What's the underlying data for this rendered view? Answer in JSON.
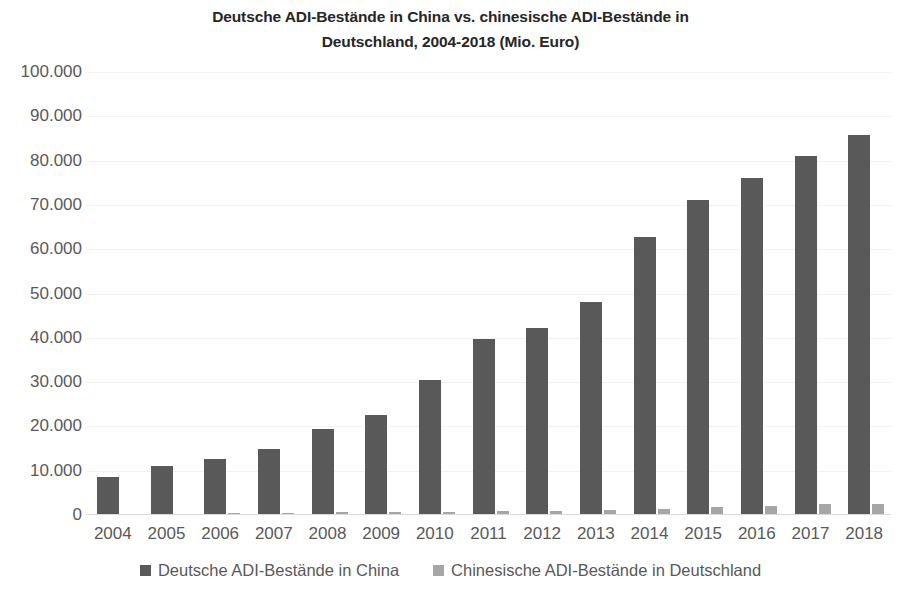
{
  "chart_data": {
    "type": "bar",
    "title": "Deutsche ADI-Bestände in China vs. chinesische ADI-Bestände in Deutschland, 2004-2018 (Mio. Euro)",
    "title_line1": "Deutsche ADI-Bestände in China vs. chinesische ADI-Bestände in",
    "title_line2": "Deutschland, 2004-2018 (Mio. Euro)",
    "xlabel": "",
    "ylabel": "",
    "ylim": [
      0,
      100000
    ],
    "ytick_step": 10000,
    "grid": true,
    "legend_position": "bottom",
    "categories": [
      "2004",
      "2005",
      "2006",
      "2007",
      "2008",
      "2009",
      "2010",
      "2011",
      "2012",
      "2013",
      "2014",
      "2015",
      "2016",
      "2017",
      "2018"
    ],
    "ytick_labels": [
      "100.000",
      "90.000",
      "80.000",
      "70.000",
      "60.000",
      "50.000",
      "40.000",
      "30.000",
      "20.000",
      "10.000",
      "0"
    ],
    "ytick_values": [
      100000,
      90000,
      80000,
      70000,
      60000,
      50000,
      40000,
      30000,
      20000,
      10000,
      0
    ],
    "series": [
      {
        "name": "Deutsche ADI-Bestände in China",
        "color": "#595959",
        "values": [
          8500,
          11000,
          12700,
          15000,
          19500,
          22600,
          30400,
          39700,
          42300,
          48000,
          62700,
          71000,
          76000,
          81000,
          85800
        ]
      },
      {
        "name": "Chinesische ADI-Bestände in Deutschland",
        "color": "#a6a6a6",
        "values": [
          200,
          300,
          400,
          450,
          600,
          700,
          750,
          900,
          900,
          1100,
          1300,
          1800,
          2000,
          2500,
          2500
        ]
      }
    ]
  },
  "legend": {
    "items": [
      {
        "label": "Deutsche ADI-Bestände in China",
        "color": "#595959"
      },
      {
        "label": "Chinesische ADI-Bestände in Deutschland",
        "color": "#a6a6a6"
      }
    ]
  }
}
